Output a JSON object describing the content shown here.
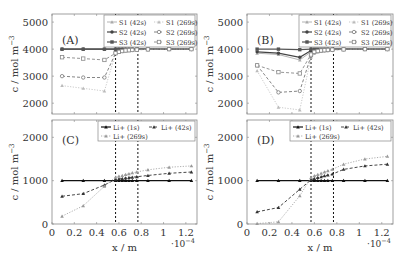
{
  "figure": {
    "vlines_x": [
      0.57,
      0.77
    ],
    "xlabel": "x / m",
    "ylabel": "c / mol m",
    "ylabel_sup": "−3",
    "x_multiplier": "·10",
    "x_multiplier_exp": "−4",
    "xticks": [
      "0",
      "0.2",
      "0.4",
      "0.6",
      "0.8",
      "1",
      "1.2"
    ]
  },
  "chart_data": [
    {
      "panel": "A",
      "type": "line",
      "title": "(A)",
      "xlabel": "",
      "ylabel": "c / mol m^-3",
      "xlim": [
        0,
        1.3
      ],
      "ylim": [
        1600,
        5300
      ],
      "yticks": [
        2000,
        3000,
        4000,
        5000
      ],
      "legend": [
        "S1 (42s)",
        "S1 (269s)",
        "S2 (42s)",
        "S2 (269s)",
        "S3 (42s)",
        "S3 (269s)"
      ],
      "x": [
        0.09,
        0.28,
        0.47,
        0.57,
        0.6,
        0.63,
        0.66,
        0.69,
        0.72,
        0.76,
        0.86,
        1.05,
        1.25
      ],
      "series": [
        {
          "name": "S1 (42s)",
          "style": "solid-light",
          "color": "#aaaaaa",
          "marker": "tri",
          "values": [
            4000,
            4000,
            4000,
            4000,
            4000,
            4000,
            4000,
            4000,
            4000,
            4000,
            4000,
            4000,
            4000
          ]
        },
        {
          "name": "S2 (42s)",
          "style": "solid",
          "color": "#444444",
          "marker": "circle",
          "values": [
            4000,
            4000,
            4000,
            4000,
            4000,
            4000,
            4000,
            4000,
            4000,
            4000,
            4000,
            4000,
            4000
          ]
        },
        {
          "name": "S3 (42s)",
          "style": "solid",
          "color": "#555555",
          "marker": "square",
          "values": [
            4000,
            4000,
            4000,
            4000,
            4000,
            4000,
            4000,
            4000,
            4000,
            4000,
            4000,
            4000,
            4000
          ]
        },
        {
          "name": "S1 (269s)",
          "style": "dotted-light",
          "color": "#bbbbbb",
          "marker": "tri",
          "values": [
            2650,
            2550,
            2450,
            3850,
            3900,
            3930,
            3950,
            3960,
            3970,
            3980,
            3990,
            4000,
            4000
          ]
        },
        {
          "name": "S2 (269s)",
          "style": "dashed",
          "color": "#777777",
          "marker": "circle-open",
          "values": [
            3000,
            2950,
            2950,
            3850,
            3900,
            3930,
            3950,
            3960,
            3970,
            3980,
            3990,
            4000,
            4000
          ]
        },
        {
          "name": "S3 (269s)",
          "style": "dashed",
          "color": "#888888",
          "marker": "square-open",
          "values": [
            3700,
            3650,
            3600,
            3850,
            3900,
            3930,
            3950,
            3960,
            3970,
            3980,
            3990,
            4000,
            4000
          ]
        }
      ]
    },
    {
      "panel": "B",
      "type": "line",
      "title": "(B)",
      "xlabel": "",
      "ylabel": "c / mol m^-3",
      "xlim": [
        0,
        1.3
      ],
      "ylim": [
        1600,
        5300
      ],
      "yticks": [
        2000,
        3000,
        4000,
        5000
      ],
      "legend": [
        "S1 (42s)",
        "S1 (269s)",
        "S2 (42s)",
        "S2 (269s)",
        "S3 (42s)",
        "S3 (269s)"
      ],
      "x": [
        0.09,
        0.28,
        0.47,
        0.57,
        0.6,
        0.63,
        0.66,
        0.69,
        0.72,
        0.76,
        0.86,
        1.05,
        1.25
      ],
      "series": [
        {
          "name": "S1 (42s)",
          "style": "solid-light",
          "color": "#aaaaaa",
          "marker": "tri",
          "values": [
            3850,
            3800,
            3600,
            3900,
            3930,
            3950,
            3960,
            3970,
            3980,
            3990,
            4000,
            4000,
            4000
          ]
        },
        {
          "name": "S2 (42s)",
          "style": "solid",
          "color": "#444444",
          "marker": "circle",
          "values": [
            3900,
            3850,
            3700,
            3950,
            3960,
            3970,
            3980,
            3990,
            4000,
            4000,
            4000,
            4000,
            4000
          ]
        },
        {
          "name": "S3 (42s)",
          "style": "solid",
          "color": "#555555",
          "marker": "square",
          "values": [
            4000,
            4000,
            3980,
            4000,
            4000,
            4000,
            4000,
            4000,
            4000,
            4000,
            4000,
            4000,
            4000
          ]
        },
        {
          "name": "S1 (269s)",
          "style": "dotted-light",
          "color": "#bbbbbb",
          "marker": "tri",
          "values": [
            3200,
            1850,
            1750,
            3700,
            3850,
            3900,
            3930,
            3950,
            3960,
            3970,
            3990,
            4000,
            4000
          ]
        },
        {
          "name": "S2 (269s)",
          "style": "dashed",
          "color": "#777777",
          "marker": "circle-open",
          "values": [
            3400,
            2400,
            2450,
            3750,
            3880,
            3920,
            3940,
            3950,
            3960,
            3970,
            3990,
            4000,
            4000
          ]
        },
        {
          "name": "S3 (269s)",
          "style": "dashed",
          "color": "#888888",
          "marker": "square-open",
          "values": [
            3400,
            3150,
            3100,
            3800,
            3900,
            3930,
            3950,
            3960,
            3970,
            3980,
            3990,
            4000,
            4000
          ]
        }
      ]
    },
    {
      "panel": "C",
      "type": "line",
      "title": "(C)",
      "xlabel": "x / m",
      "ylabel": "c / mol m^-3",
      "xlim": [
        0,
        1.3
      ],
      "ylim": [
        0,
        2400
      ],
      "yticks": [
        0,
        1000,
        2000
      ],
      "legend": [
        "Li+ (1s)",
        "Li+ (42s)",
        "Li+ (269s)"
      ],
      "x": [
        0.09,
        0.28,
        0.47,
        0.57,
        0.6,
        0.63,
        0.66,
        0.69,
        0.72,
        0.76,
        0.86,
        1.05,
        1.25
      ],
      "series": [
        {
          "name": "Li+ (1s)",
          "style": "solid",
          "color": "#111111",
          "marker": "tri",
          "values": [
            1000,
            1000,
            1000,
            1000,
            1000,
            1000,
            1000,
            1000,
            1000,
            1000,
            1000,
            1000,
            1000
          ]
        },
        {
          "name": "Li+ (42s)",
          "style": "dashed",
          "color": "#333333",
          "marker": "tri",
          "values": [
            640,
            700,
            900,
            1030,
            1040,
            1050,
            1060,
            1070,
            1080,
            1090,
            1120,
            1170,
            1200
          ]
        },
        {
          "name": "Li+ (269s)",
          "style": "dotted-light",
          "color": "#999999",
          "marker": "tri",
          "values": [
            180,
            420,
            870,
            1080,
            1100,
            1120,
            1140,
            1160,
            1180,
            1200,
            1250,
            1310,
            1340
          ]
        }
      ]
    },
    {
      "panel": "D",
      "type": "line",
      "title": "(D)",
      "xlabel": "x / m",
      "ylabel": "c / mol m^-3",
      "xlim": [
        0,
        1.3
      ],
      "ylim": [
        0,
        2400
      ],
      "yticks": [
        0,
        1000,
        2000
      ],
      "legend": [
        "Li+ (1s)",
        "Li+ (42s)",
        "Li+ (269s)"
      ],
      "x": [
        0.09,
        0.28,
        0.47,
        0.57,
        0.6,
        0.63,
        0.66,
        0.69,
        0.72,
        0.76,
        0.86,
        1.05,
        1.25
      ],
      "series": [
        {
          "name": "Li+ (1s)",
          "style": "solid",
          "color": "#111111",
          "marker": "tri",
          "values": [
            1000,
            1000,
            1000,
            1000,
            1000,
            1000,
            1000,
            1000,
            1000,
            1000,
            1000,
            1000,
            1000
          ]
        },
        {
          "name": "Li+ (42s)",
          "style": "dashed",
          "color": "#333333",
          "marker": "tri",
          "values": [
            280,
            380,
            800,
            1020,
            1050,
            1070,
            1090,
            1110,
            1130,
            1150,
            1260,
            1340,
            1380
          ]
        },
        {
          "name": "Li+ (269s)",
          "style": "dotted-light",
          "color": "#999999",
          "marker": "tri",
          "values": [
            10,
            50,
            650,
            1070,
            1110,
            1140,
            1170,
            1200,
            1230,
            1260,
            1380,
            1500,
            1560
          ]
        }
      ]
    }
  ]
}
